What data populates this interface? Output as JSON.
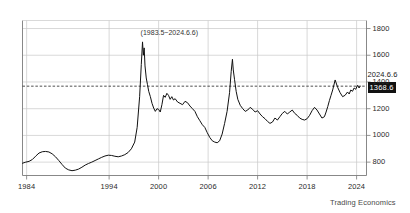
{
  "chart_data": {
    "type": "line",
    "title": "(1983.5~2024.6.6)",
    "xlabel": "",
    "ylabel": "",
    "xlim": [
      1983.5,
      2025.2
    ],
    "ylim": [
      700,
      1860
    ],
    "grid": true,
    "legend": "none",
    "y_ticks": [
      1800,
      1600,
      1400,
      1200,
      1000,
      800
    ],
    "x_ticks": [
      1984,
      1994,
      2000,
      2006,
      2012,
      2018,
      2024
    ],
    "x_tick_labels": [
      "1984",
      "1994",
      "2000",
      "2006",
      "2012",
      "2018",
      "2024"
    ],
    "y_tick_labels": [
      "1800",
      "1600",
      "1400",
      "1200",
      "1000",
      "800"
    ],
    "line_color": "#111111",
    "grid_color": "#c8c8c8",
    "axis_color": "#7a7a7a",
    "background_color": "#ffffff",
    "reference_line": {
      "value": 1368.6,
      "style": "dashed",
      "color": "#222222"
    },
    "last_point": {
      "date": "2024.6.6",
      "value": 1368.6,
      "value_label": "1368.6",
      "badge_color": "#111111",
      "badge_text_color": "#ffffff"
    },
    "series": [
      {
        "name": "index",
        "x": [
          1983.5,
          1983.9,
          1984.3,
          1984.7,
          1985.1,
          1985.5,
          1985.9,
          1986.3,
          1986.7,
          1987.1,
          1987.5,
          1987.9,
          1988.3,
          1988.7,
          1989.1,
          1989.5,
          1989.9,
          1990.3,
          1990.7,
          1991.1,
          1991.5,
          1991.9,
          1992.3,
          1992.7,
          1993.1,
          1993.5,
          1993.9,
          1994.3,
          1994.7,
          1995.1,
          1995.5,
          1995.9,
          1996.3,
          1996.7,
          1997.1,
          1997.4,
          1997.7,
          1997.9,
          1998.05,
          1998.15,
          1998.25,
          1998.35,
          1998.5,
          1998.65,
          1998.8,
          1999.0,
          1999.2,
          1999.4,
          1999.6,
          1999.8,
          2000.0,
          2000.2,
          2000.4,
          2000.6,
          2000.8,
          2001.0,
          2001.2,
          2001.4,
          2001.6,
          2001.8,
          2002.0,
          2002.3,
          2002.6,
          2002.9,
          2003.2,
          2003.5,
          2003.8,
          2004.1,
          2004.4,
          2004.7,
          2005.0,
          2005.3,
          2005.6,
          2005.9,
          2006.2,
          2006.5,
          2006.8,
          2007.1,
          2007.4,
          2007.7,
          2008.0,
          2008.3,
          2008.6,
          2008.8,
          2008.95,
          2009.05,
          2009.2,
          2009.4,
          2009.6,
          2009.9,
          2010.2,
          2010.5,
          2010.8,
          2011.1,
          2011.4,
          2011.7,
          2012.0,
          2012.3,
          2012.6,
          2012.9,
          2013.2,
          2013.5,
          2013.8,
          2014.1,
          2014.4,
          2014.7,
          2015.0,
          2015.3,
          2015.6,
          2015.9,
          2016.2,
          2016.5,
          2016.8,
          2017.1,
          2017.4,
          2017.7,
          2018.0,
          2018.3,
          2018.6,
          2018.9,
          2019.2,
          2019.5,
          2019.8,
          2020.1,
          2020.3,
          2020.5,
          2020.7,
          2020.9,
          2021.1,
          2021.4,
          2021.7,
          2022.0,
          2022.3,
          2022.6,
          2022.9,
          2023.1,
          2023.3,
          2023.5,
          2023.7,
          2023.9,
          2024.1,
          2024.3,
          2024.43
        ],
        "y": [
          792,
          800,
          806,
          820,
          845,
          868,
          878,
          880,
          876,
          862,
          840,
          812,
          782,
          755,
          742,
          736,
          740,
          748,
          762,
          778,
          790,
          800,
          812,
          824,
          836,
          846,
          852,
          850,
          844,
          840,
          846,
          856,
          872,
          900,
          950,
          1060,
          1290,
          1530,
          1700,
          1600,
          1655,
          1520,
          1430,
          1380,
          1330,
          1290,
          1240,
          1205,
          1180,
          1200,
          1195,
          1175,
          1230,
          1300,
          1285,
          1315,
          1300,
          1270,
          1290,
          1265,
          1275,
          1250,
          1240,
          1230,
          1255,
          1245,
          1220,
          1200,
          1180,
          1140,
          1110,
          1080,
          1060,
          1020,
          985,
          960,
          950,
          945,
          960,
          1010,
          1090,
          1180,
          1320,
          1480,
          1570,
          1490,
          1420,
          1330,
          1270,
          1225,
          1200,
          1180,
          1190,
          1210,
          1195,
          1175,
          1185,
          1160,
          1140,
          1125,
          1105,
          1090,
          1100,
          1130,
          1115,
          1140,
          1165,
          1180,
          1160,
          1175,
          1190,
          1165,
          1150,
          1130,
          1120,
          1115,
          1125,
          1150,
          1185,
          1210,
          1190,
          1160,
          1130,
          1140,
          1175,
          1215,
          1260,
          1300,
          1340,
          1415,
          1360,
          1320,
          1290,
          1300,
          1325,
          1310,
          1340,
          1330,
          1355,
          1345,
          1375,
          1355,
          1368.6
        ]
      }
    ]
  },
  "footer": {
    "watermark": "Trading Economics"
  }
}
